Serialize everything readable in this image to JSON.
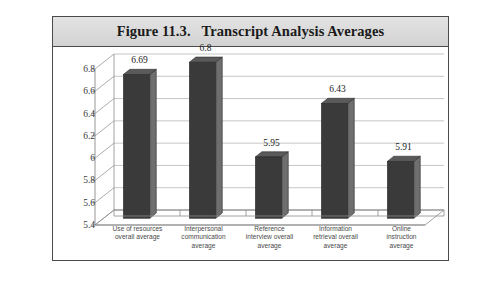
{
  "figure": {
    "title": "Figure 11.3.   Transcript Analysis Averages"
  },
  "chart_data": {
    "type": "bar",
    "title": "Figure 11.3.  Transcript Analysis Averages",
    "xlabel": "",
    "ylabel": "",
    "ylim": [
      5.4,
      6.8
    ],
    "yticks": [
      "5.4",
      "5.6",
      "5.8",
      "6",
      "6.2",
      "6.4",
      "6.6",
      "6.8"
    ],
    "grid": true,
    "legend": false,
    "three_d": true,
    "categories": [
      "Use of resources overall average",
      "Interpersonal communication average",
      "Reference interview overall average",
      "Information retrieval overall average",
      "Online instruction average"
    ],
    "category_lines": [
      [
        "Use of resources",
        "overall average"
      ],
      [
        "Interpersonal",
        "communication",
        "average"
      ],
      [
        "Reference",
        "interview overall",
        "average"
      ],
      [
        "Information",
        "retrieval overall",
        "average"
      ],
      [
        "Online",
        "instruction",
        "average"
      ]
    ],
    "values": [
      6.69,
      6.8,
      5.95,
      6.43,
      5.91
    ],
    "value_labels": [
      "6.69",
      "6.8",
      "5.95",
      "6.43",
      "5.91"
    ],
    "colors": {
      "bar_front": "#3a3a3a",
      "bar_side": "#6e6e6e",
      "bar_top": "#5a5a5a",
      "gridline": "#b8b8b8",
      "axis": "#8a8a8a",
      "floor": "#ffffff",
      "header_bg": "#dcdcdc",
      "frame": "#4a4a4a",
      "text": "#3a3a3a"
    }
  }
}
